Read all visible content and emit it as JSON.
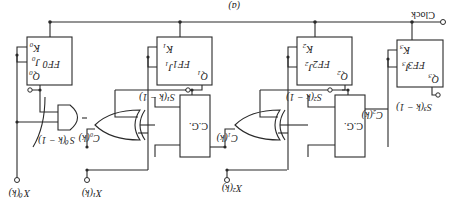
{
  "figure": {
    "caption": "(a)",
    "orientation": "rotated 180 degrees"
  },
  "clock": {
    "label": "Clock"
  },
  "flip_flops": [
    {
      "name": "FF0",
      "Q": "Q",
      "Q_sub": "0",
      "J": "J",
      "J_sub": "0",
      "K": "K",
      "K_sub": "0"
    },
    {
      "name": "FF1",
      "Q": "Q",
      "Q_sub": "1",
      "J": "J",
      "J_sub": "1",
      "K": "K",
      "K_sub": "1"
    },
    {
      "name": "FF2",
      "Q": "Q",
      "Q_sub": "2",
      "J": "J",
      "J_sub": "2",
      "K": "K",
      "K_sub": "2"
    },
    {
      "name": "FF3",
      "Q": "Q",
      "Q_sub": "3",
      "J": "J",
      "J_sub": "3",
      "K": "K",
      "K_sub": "3"
    }
  ],
  "carry_generators": [
    {
      "label": "C.G."
    },
    {
      "label": "C.G."
    }
  ],
  "signals": {
    "s0": "S⁰(k − 1)",
    "s1": "S¹(k − 1)",
    "s2": "S²(k − 1)",
    "s3": "S³(k − 1)",
    "c0": "C₀(k)",
    "c1": "C₁(k)",
    "c2": "C₂(k)"
  },
  "inputs": [
    {
      "label": "X⁰(k)"
    },
    {
      "label": "X¹(k)"
    },
    {
      "label": "X²(k)"
    }
  ],
  "colors": {
    "ink": "#2a2a2a",
    "background": "#ffffff"
  }
}
